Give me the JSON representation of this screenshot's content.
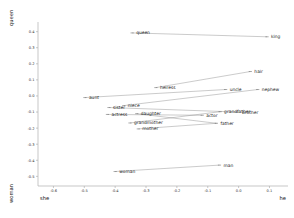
{
  "chart_data": {
    "type": "scatter",
    "title": "",
    "subtitle": "",
    "xlabel": "",
    "ylabel": "",
    "x_axis_left_name": "she",
    "x_axis_right_name": "he",
    "y_axis_bottom_name": "woman",
    "y_axis_top_name": "queen",
    "xlim": [
      -0.65,
      0.16
    ],
    "ylim": [
      -0.56,
      0.46
    ],
    "xticks": [
      -0.6,
      -0.5,
      -0.4,
      -0.3,
      -0.2,
      -0.1,
      0.0,
      0.1
    ],
    "xticklabels": [
      "-0.6",
      "-0.5",
      "-0.4",
      "-0.3",
      "-0.2",
      "-0.1",
      "0.0",
      "0.1"
    ],
    "yticks": [
      0.4,
      0.3,
      0.2,
      0.1,
      0.0,
      -0.1,
      -0.2,
      -0.3,
      -0.4,
      -0.5
    ],
    "yticklabels": [
      "0.4",
      "0.3",
      "0.2",
      "0.1",
      "0.0",
      "-0.1",
      "-0.2",
      "-0.3",
      "-0.4",
      "-0.5"
    ],
    "grid": false,
    "legend": false,
    "legend_position": "none",
    "points": [
      {
        "label": "queen",
        "x": -0.345,
        "y": 0.392
      },
      {
        "label": "king",
        "x": 0.092,
        "y": 0.368
      },
      {
        "label": "hair",
        "x": 0.038,
        "y": 0.152
      },
      {
        "label": "heiress",
        "x": -0.268,
        "y": 0.052
      },
      {
        "label": "uncle",
        "x": -0.042,
        "y": 0.04
      },
      {
        "label": "nephew",
        "x": 0.062,
        "y": 0.04
      },
      {
        "label": "aunt",
        "x": -0.498,
        "y": -0.01
      },
      {
        "label": "sister",
        "x": -0.42,
        "y": -0.072
      },
      {
        "label": "niece",
        "x": -0.372,
        "y": -0.06
      },
      {
        "label": "actress",
        "x": -0.425,
        "y": -0.115
      },
      {
        "label": "daughter",
        "x": -0.33,
        "y": -0.11
      },
      {
        "label": "grandfather",
        "x": -0.06,
        "y": -0.098
      },
      {
        "label": "brother",
        "x": -0.002,
        "y": -0.1
      },
      {
        "label": "actor",
        "x": -0.118,
        "y": -0.12
      },
      {
        "label": "grandmother",
        "x": -0.352,
        "y": -0.168
      },
      {
        "label": "father",
        "x": -0.072,
        "y": -0.17
      },
      {
        "label": "mother",
        "x": -0.325,
        "y": -0.205
      },
      {
        "label": "woman",
        "x": -0.4,
        "y": -0.47
      },
      {
        "label": "man",
        "x": -0.062,
        "y": -0.43
      }
    ],
    "pairs": [
      {
        "female": "queen",
        "male": "king"
      },
      {
        "female": "heiress",
        "male": "hair"
      },
      {
        "female": "aunt",
        "male": "uncle"
      },
      {
        "female": "niece",
        "male": "nephew"
      },
      {
        "female": "sister",
        "male": "brother"
      },
      {
        "female": "actress",
        "male": "actor"
      },
      {
        "female": "daughter",
        "male": "father"
      },
      {
        "female": "grandmother",
        "male": "grandfather"
      },
      {
        "female": "mother",
        "male": "father"
      },
      {
        "female": "woman",
        "male": "man"
      }
    ],
    "colors": {
      "point": "#5a5a5a",
      "line": "#8a8a8a",
      "axis": "#b0b0b0",
      "text": "#1a1a1a",
      "background": "#ffffff"
    },
    "label_offsets": {
      "queen": {
        "dx": 4,
        "dy": 1.5,
        "anchor": "start"
      },
      "king": {
        "dx": 4,
        "dy": 1.5,
        "anchor": "start"
      },
      "hair": {
        "dx": 4,
        "dy": 1.5,
        "anchor": "start"
      },
      "heiress": {
        "dx": 4,
        "dy": 1.5,
        "anchor": "start"
      },
      "uncle": {
        "dx": 4,
        "dy": 1.5,
        "anchor": "start"
      },
      "nephew": {
        "dx": 4,
        "dy": 1.5,
        "anchor": "start"
      },
      "aunt": {
        "dx": 4,
        "dy": 1.5,
        "anchor": "start"
      },
      "sister": {
        "dx": 4,
        "dy": 1.5,
        "anchor": "start"
      },
      "niece": {
        "dx": 4,
        "dy": 1.5,
        "anchor": "start"
      },
      "actress": {
        "dx": 4,
        "dy": 1.5,
        "anchor": "start"
      },
      "daughter": {
        "dx": 4,
        "dy": 1.5,
        "anchor": "start"
      },
      "grandfather": {
        "dx": 4,
        "dy": 1.5,
        "anchor": "start"
      },
      "brother": {
        "dx": 4,
        "dy": 1.5,
        "anchor": "start"
      },
      "actor": {
        "dx": 4,
        "dy": 1.5,
        "anchor": "start"
      },
      "grandmother": {
        "dx": 4,
        "dy": 1.5,
        "anchor": "start"
      },
      "father": {
        "dx": 4,
        "dy": 1.5,
        "anchor": "start"
      },
      "mother": {
        "dx": 4,
        "dy": 1.5,
        "anchor": "start"
      },
      "woman": {
        "dx": 4,
        "dy": 1.5,
        "anchor": "start"
      },
      "man": {
        "dx": 4,
        "dy": 1.5,
        "anchor": "start"
      }
    }
  }
}
